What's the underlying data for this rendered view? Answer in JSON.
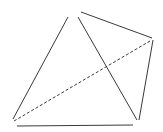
{
  "diagram": {
    "type": "geometric-figure",
    "stroke_color": "#3a3a3a",
    "background": "#ffffff",
    "segments": [
      {
        "name": "left-edge",
        "x1": 13,
        "y1": 119,
        "x2": 68,
        "y2": 17,
        "style": "solid"
      },
      {
        "name": "inner-diagonal",
        "x1": 78,
        "y1": 17,
        "x2": 137,
        "y2": 120,
        "style": "solid"
      },
      {
        "name": "top-edge",
        "x1": 81,
        "y1": 12,
        "x2": 152,
        "y2": 38,
        "style": "solid"
      },
      {
        "name": "right-edge",
        "x1": 153,
        "y1": 40,
        "x2": 139,
        "y2": 120,
        "style": "solid"
      },
      {
        "name": "bottom-edge",
        "x1": 17,
        "y1": 126,
        "x2": 133,
        "y2": 125,
        "style": "solid"
      },
      {
        "name": "dashed-diagonal",
        "x1": 14,
        "y1": 121,
        "x2": 150,
        "y2": 41,
        "style": "dashed"
      }
    ]
  }
}
